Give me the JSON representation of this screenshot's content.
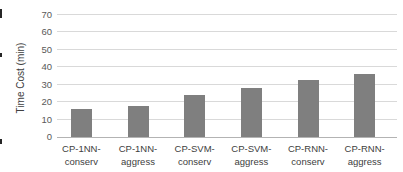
{
  "chart_data": {
    "type": "bar",
    "title": "",
    "xlabel": "",
    "ylabel": "Time Cost (min)",
    "ylim": [
      0,
      70
    ],
    "yticks": [
      0,
      10,
      20,
      30,
      40,
      50,
      60,
      70
    ],
    "grid": "horizontal",
    "legend_position": "none",
    "categories": [
      "CP-1NN-conserv",
      "CP-1NN-aggress",
      "CP-SVM-conserv",
      "CP-SVM-aggress",
      "CP-RNN-conserv",
      "CP-RNN-aggress"
    ],
    "category_labels": [
      [
        "CP-1NN-",
        "conserv"
      ],
      [
        "CP-1NN-",
        "aggress"
      ],
      [
        "CP-SVM-",
        "conserv"
      ],
      [
        "CP-SVM-",
        "aggress"
      ],
      [
        "CP-RNN-",
        "conserv"
      ],
      [
        "CP-RNN-",
        "aggress"
      ]
    ],
    "values": [
      16,
      18,
      24,
      28,
      33,
      36
    ],
    "bar_color": "#7f7f7f",
    "gridline_color": "#d9d9d9",
    "axis_line_color": "#b3b3b3",
    "tick_label_color": "#595959",
    "category_label_color": "#404040",
    "axis_title_color": "#404040",
    "background_color": "#ffffff"
  }
}
